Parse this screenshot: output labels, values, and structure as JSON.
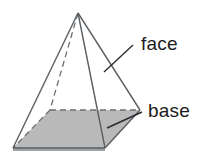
{
  "figure": {
    "shape_name": "square-pyramid",
    "background_color": "#ffffff",
    "line_color": "#5a5f63",
    "base_fill_color": "#b9b9b9",
    "label_color": "#1b1b1b",
    "vertices": {
      "apex": [
        78,
        13
      ],
      "front_left": [
        13,
        148
      ],
      "front_right": [
        105,
        148
      ],
      "back_right": [
        140,
        110
      ],
      "back_left_hidden": [
        50,
        110
      ]
    },
    "labels": [
      {
        "id": "face",
        "text": "face",
        "x": 141,
        "y": 50,
        "leader_from": [
          104,
          72
        ],
        "leader_to": [
          133,
          45
        ]
      },
      {
        "id": "base",
        "text": "base",
        "x": 148,
        "y": 117,
        "leader_from": [
          107,
          128
        ],
        "leader_to": [
          142,
          112
        ]
      }
    ]
  }
}
